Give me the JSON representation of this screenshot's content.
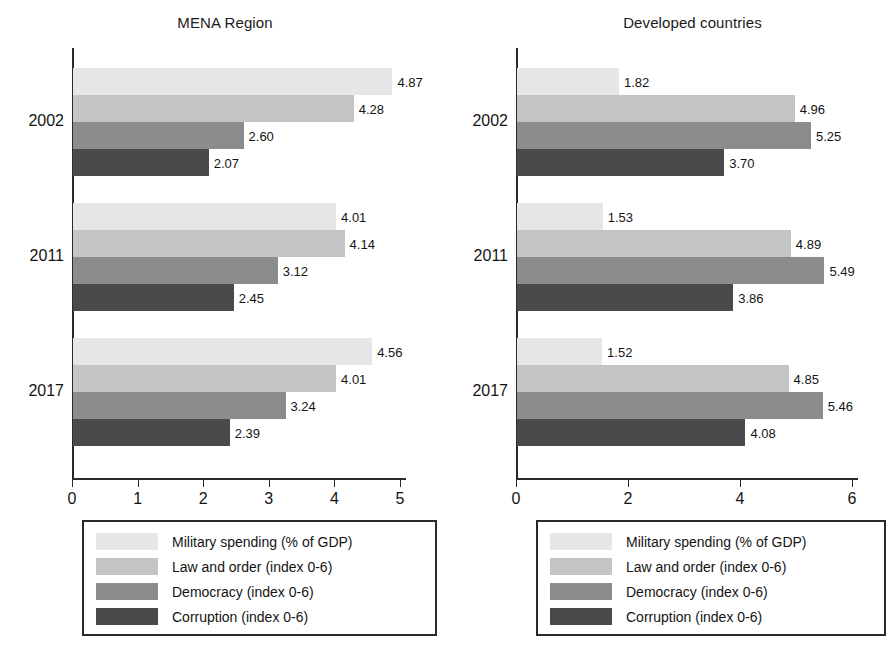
{
  "chart_data": [
    {
      "type": "bar",
      "title": "MENA Region",
      "orientation": "horizontal",
      "xlabel": "",
      "ylabel": "",
      "xlim": [
        0,
        5
      ],
      "xticks": [
        "0",
        "1",
        "2",
        "3",
        "4",
        "5"
      ],
      "grid": false,
      "legend_position": "bottom",
      "categories": [
        "2002",
        "2011",
        "2017"
      ],
      "series": [
        {
          "name": "Military spending (% of GDP)",
          "color": "#e6e6e6",
          "values": [
            4.87,
            4.01,
            4.56
          ],
          "labels": [
            "4.87",
            "4.01",
            "4.56"
          ]
        },
        {
          "name": "Law and order (index 0-6)",
          "color": "#c4c4c4",
          "values": [
            4.28,
            4.14,
            4.01
          ],
          "labels": [
            "4.28",
            "4.14",
            "4.01"
          ]
        },
        {
          "name": "Democracy (index 0-6)",
          "color": "#8c8c8c",
          "values": [
            2.6,
            3.12,
            3.24
          ],
          "labels": [
            "2.60",
            "3.12",
            "3.24"
          ]
        },
        {
          "name": "Corruption (index 0-6)",
          "color": "#4a4a4a",
          "values": [
            2.07,
            2.45,
            2.39
          ],
          "labels": [
            "2.07",
            "2.45",
            "2.39"
          ]
        }
      ],
      "legend": [
        {
          "label": "Military spending (% of GDP)",
          "color": "#e6e6e6"
        },
        {
          "label": "Law and order (index 0-6)",
          "color": "#c4c4c4"
        },
        {
          "label": "Democracy (index 0-6)",
          "color": "#8c8c8c"
        },
        {
          "label": "Corruption (index 0-6)",
          "color": "#4a4a4a"
        }
      ]
    },
    {
      "type": "bar",
      "title": "Developed countries",
      "orientation": "horizontal",
      "xlabel": "",
      "ylabel": "",
      "xlim": [
        0,
        6
      ],
      "xticks": [
        "0",
        "2",
        "4",
        "6"
      ],
      "grid": false,
      "legend_position": "bottom",
      "categories": [
        "2002",
        "2011",
        "2017"
      ],
      "series": [
        {
          "name": "Military spending  (% of GDP)",
          "color": "#e6e6e6",
          "values": [
            1.82,
            1.53,
            1.52
          ],
          "labels": [
            "1.82",
            "1.53",
            "1.52"
          ]
        },
        {
          "name": "Law and order (index 0-6)",
          "color": "#c4c4c4",
          "values": [
            4.96,
            4.89,
            4.85
          ],
          "labels": [
            "4.96",
            "4.89",
            "4.85"
          ]
        },
        {
          "name": "Democracy (index 0-6)",
          "color": "#8c8c8c",
          "values": [
            5.25,
            5.49,
            5.46
          ],
          "labels": [
            "5.25",
            "5.49",
            "5.46"
          ]
        },
        {
          "name": "Corruption (index 0-6)",
          "color": "#4a4a4a",
          "values": [
            3.7,
            3.86,
            4.08
          ],
          "labels": [
            "3.70",
            "3.86",
            "4.08"
          ]
        }
      ],
      "legend": [
        {
          "label": "Military spending  (% of GDP)",
          "color": "#e6e6e6"
        },
        {
          "label": "Law and order (index 0-6)",
          "color": "#c4c4c4"
        },
        {
          "label": "Democracy (index 0-6)",
          "color": "#8c8c8c"
        },
        {
          "label": "Corruption (index 0-6)",
          "color": "#4a4a4a"
        }
      ]
    }
  ]
}
